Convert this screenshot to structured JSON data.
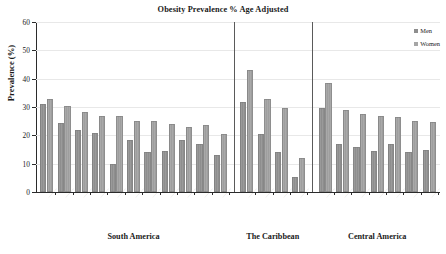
{
  "chart_data": {
    "type": "bar",
    "title": "Obesity Prevalence % Age Adjusted",
    "xlabel": "",
    "ylabel": "Prevalence (%)",
    "ylim": [
      0,
      60
    ],
    "ytick_labels": [
      "60",
      "50",
      "40",
      "30",
      "20",
      "10",
      "0"
    ],
    "ytick_values": [
      60,
      50,
      40,
      30,
      20,
      10,
      0
    ],
    "ytick_step": 10,
    "grid": true,
    "grid_axis": "y",
    "legend_position": "top-right",
    "legend_entries": [
      "Men",
      "Women"
    ],
    "series": [
      {
        "name": "Men",
        "color": "#8e8e8e",
        "values": [
          31,
          24.5,
          22,
          20.8,
          10,
          18.4,
          14,
          14.4,
          18.3,
          16.8,
          13,
          31.6,
          20.3,
          14,
          5.2,
          29.6,
          16.9,
          16,
          14.4,
          16.8,
          14,
          14.7
        ]
      },
      {
        "name": "Women",
        "color": "#a6a6a6",
        "values": [
          33,
          30.3,
          28.2,
          27,
          26.8,
          25,
          25,
          24,
          23,
          23.5,
          20.3,
          43,
          33,
          29.5,
          12,
          38.5,
          29,
          27.7,
          26.8,
          26.3,
          25.2,
          24.8
        ]
      }
    ],
    "groups": [
      {
        "label": "South America",
        "n_categories": 11,
        "categories": [
          "",
          "",
          "",
          "",
          "",
          "",
          "",
          "",
          "",
          "",
          ""
        ]
      },
      {
        "label": "The Caribbean",
        "n_categories": 4,
        "categories": [
          "",
          "",
          "",
          ""
        ]
      },
      {
        "label": "Central America",
        "n_categories": 7,
        "categories": [
          "",
          "",
          "",
          "",
          "",
          "",
          ""
        ]
      }
    ],
    "categories": [
      "",
      "",
      "",
      "",
      "",
      "",
      "",
      "",
      "",
      "",
      "",
      "",
      "",
      "",
      "",
      "",
      "",
      "",
      "",
      "",
      "",
      ""
    ],
    "note": "Category tick labels are rotated approximately 45 degrees and rendered too small to resolve in the source image."
  },
  "chart": {
    "title": "Obesity Prevalence % Age Adjusted",
    "y_axis_label": "Prevalence (%)"
  },
  "legend": {
    "items": [
      {
        "label": "Men"
      },
      {
        "label": "Women"
      }
    ]
  },
  "groups": [
    {
      "label": "South America"
    },
    {
      "label": "The Caribbean"
    },
    {
      "label": "Central America"
    }
  ],
  "y_ticks": [
    {
      "label": "60"
    },
    {
      "label": "50"
    },
    {
      "label": "40"
    },
    {
      "label": "30"
    },
    {
      "label": "20"
    },
    {
      "label": "10"
    },
    {
      "label": "0"
    }
  ]
}
